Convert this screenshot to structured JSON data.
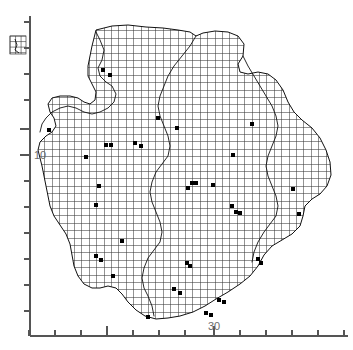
{
  "chart_data": {
    "type": "scatter",
    "title": "",
    "subtitle": "",
    "xlabel": "",
    "ylabel": "",
    "grid": true,
    "legend": "none",
    "axes": {
      "x": {
        "spine_color": "#555555",
        "tick_labels": [
          "30"
        ],
        "tick_label_values": [
          30
        ],
        "tick_label_positions_px": [
          214
        ],
        "tick_positions_px": [
          29,
          55,
          81,
          107,
          133,
          159,
          185,
          214,
          240,
          266,
          292,
          318,
          344
        ],
        "major_tick_positions_px": [
          107,
          214
        ],
        "axis_y_px": 336,
        "range_px": [
          29,
          348
        ],
        "tick_length": 6,
        "major_tick_length": 10
      },
      "y": {
        "spine_color": "#555555",
        "tick_labels": [
          "10"
        ],
        "tick_label_values": [
          10
        ],
        "tick_label_positions_px": [
          155
        ],
        "tick_positions_px": [
          22,
          48,
          74,
          100,
          129,
          155,
          181,
          207,
          233,
          259,
          285,
          311
        ],
        "major_tick_positions_px": [
          129,
          155
        ],
        "axis_x_px": 30,
        "range_px": [
          16,
          336
        ],
        "tick_length": 6,
        "major_tick_length": 10
      }
    },
    "colors": {
      "background": "#ffffff",
      "grid_mesh": "#3b3b3b",
      "boundary_line": "#111111",
      "marker": "#000000",
      "axis": "#555555",
      "tick_label": "#6b6b6b"
    },
    "mesh": {
      "description": "fine rectangular computational mesh covering an irregular land/region polygon",
      "cell_size_px": 7.4,
      "line_width": 0.55
    },
    "markers": {
      "shape": "square",
      "size_px": 4,
      "count": 38,
      "points_px": [
        [
          103,
          70
        ],
        [
          110,
          75
        ],
        [
          158,
          118
        ],
        [
          177,
          128
        ],
        [
          106,
          145
        ],
        [
          111,
          145
        ],
        [
          135,
          143
        ],
        [
          141,
          146
        ],
        [
          86,
          157
        ],
        [
          252,
          124
        ],
        [
          99,
          186
        ],
        [
          192,
          183
        ],
        [
          196,
          183
        ],
        [
          188,
          188
        ],
        [
          213,
          185
        ],
        [
          233,
          155
        ],
        [
          96,
          205
        ],
        [
          232,
          206
        ],
        [
          236,
          212
        ],
        [
          240,
          213
        ],
        [
          293,
          189
        ],
        [
          299,
          214
        ],
        [
          122,
          241
        ],
        [
          96,
          256
        ],
        [
          101,
          260
        ],
        [
          187,
          263
        ],
        [
          190,
          266
        ],
        [
          113,
          276
        ],
        [
          174,
          289
        ],
        [
          180,
          293
        ],
        [
          219,
          300
        ],
        [
          224,
          302
        ],
        [
          206,
          313
        ],
        [
          211,
          315
        ],
        [
          148,
          317
        ],
        [
          258,
          259
        ],
        [
          261,
          263
        ],
        [
          49,
          130
        ]
      ]
    },
    "inset": {
      "description": "small detached mesh patch outside the left axis near the top",
      "bbox_px": [
        10,
        36,
        16,
        18
      ]
    },
    "region_outline_px": [
      [
        96,
        30
      ],
      [
        112,
        26
      ],
      [
        128,
        25
      ],
      [
        146,
        27
      ],
      [
        163,
        28
      ],
      [
        178,
        30
      ],
      [
        190,
        32
      ],
      [
        196,
        36
      ],
      [
        203,
        33
      ],
      [
        215,
        31
      ],
      [
        228,
        32
      ],
      [
        238,
        36
      ],
      [
        244,
        44
      ],
      [
        243,
        56
      ],
      [
        238,
        64
      ],
      [
        240,
        72
      ],
      [
        248,
        74
      ],
      [
        258,
        72
      ],
      [
        268,
        74
      ],
      [
        276,
        80
      ],
      [
        283,
        90
      ],
      [
        288,
        102
      ],
      [
        294,
        112
      ],
      [
        302,
        120
      ],
      [
        312,
        128
      ],
      [
        320,
        138
      ],
      [
        326,
        150
      ],
      [
        330,
        162
      ],
      [
        331,
        175
      ],
      [
        327,
        186
      ],
      [
        320,
        194
      ],
      [
        312,
        199
      ],
      [
        305,
        206
      ],
      [
        303,
        216
      ],
      [
        300,
        226
      ],
      [
        292,
        234
      ],
      [
        282,
        240
      ],
      [
        272,
        246
      ],
      [
        264,
        255
      ],
      [
        258,
        266
      ],
      [
        250,
        276
      ],
      [
        240,
        284
      ],
      [
        228,
        292
      ],
      [
        216,
        299
      ],
      [
        205,
        306
      ],
      [
        193,
        312
      ],
      [
        180,
        316
      ],
      [
        168,
        318
      ],
      [
        156,
        319
      ],
      [
        145,
        316
      ],
      [
        136,
        310
      ],
      [
        128,
        302
      ],
      [
        122,
        294
      ],
      [
        116,
        288
      ],
      [
        108,
        286
      ],
      [
        100,
        288
      ],
      [
        92,
        288
      ],
      [
        84,
        284
      ],
      [
        78,
        276
      ],
      [
        74,
        266
      ],
      [
        72,
        255
      ],
      [
        70,
        244
      ],
      [
        66,
        234
      ],
      [
        60,
        225
      ],
      [
        54,
        216
      ],
      [
        50,
        206
      ],
      [
        48,
        196
      ],
      [
        46,
        186
      ],
      [
        44,
        176
      ],
      [
        42,
        166
      ],
      [
        40,
        158
      ],
      [
        38,
        150
      ],
      [
        40,
        142
      ],
      [
        46,
        136
      ],
      [
        52,
        132
      ],
      [
        56,
        126
      ],
      [
        54,
        118
      ],
      [
        50,
        112
      ],
      [
        48,
        104
      ],
      [
        52,
        98
      ],
      [
        60,
        96
      ],
      [
        70,
        96
      ],
      [
        78,
        98
      ],
      [
        84,
        102
      ],
      [
        90,
        104
      ],
      [
        95,
        100
      ],
      [
        96,
        92
      ],
      [
        92,
        84
      ],
      [
        88,
        76
      ],
      [
        88,
        66
      ],
      [
        90,
        56
      ],
      [
        92,
        46
      ],
      [
        94,
        38
      ],
      [
        96,
        30
      ]
    ],
    "internal_boundaries": [
      {
        "name": "upper-internal-boundary",
        "points_px": [
          [
            96,
            32
          ],
          [
            100,
            40
          ],
          [
            104,
            50
          ],
          [
            102,
            60
          ],
          [
            98,
            68
          ],
          [
            100,
            76
          ],
          [
            106,
            82
          ],
          [
            112,
            86
          ],
          [
            116,
            94
          ],
          [
            114,
            102
          ],
          [
            108,
            108
          ],
          [
            100,
            112
          ],
          [
            92,
            114
          ],
          [
            84,
            112
          ],
          [
            76,
            108
          ],
          [
            68,
            106
          ],
          [
            60,
            108
          ],
          [
            52,
            112
          ],
          [
            46,
            118
          ],
          [
            42,
            124
          ],
          [
            40,
            132
          ]
        ]
      },
      {
        "name": "diagonal-internal-boundary",
        "points_px": [
          [
            196,
            36
          ],
          [
            190,
            46
          ],
          [
            182,
            56
          ],
          [
            174,
            66
          ],
          [
            168,
            76
          ],
          [
            164,
            86
          ],
          [
            160,
            96
          ],
          [
            158,
            106
          ],
          [
            160,
            116
          ],
          [
            164,
            126
          ],
          [
            168,
            136
          ],
          [
            170,
            146
          ],
          [
            168,
            156
          ],
          [
            162,
            164
          ],
          [
            156,
            172
          ],
          [
            152,
            182
          ],
          [
            150,
            192
          ],
          [
            152,
            202
          ],
          [
            156,
            212
          ],
          [
            160,
            222
          ],
          [
            162,
            232
          ],
          [
            160,
            242
          ],
          [
            154,
            250
          ],
          [
            148,
            258
          ],
          [
            144,
            268
          ],
          [
            142,
            278
          ],
          [
            144,
            288
          ],
          [
            148,
            296
          ],
          [
            152,
            306
          ],
          [
            154,
            316
          ]
        ]
      },
      {
        "name": "right-internal-boundary",
        "points_px": [
          [
            243,
            56
          ],
          [
            248,
            66
          ],
          [
            254,
            76
          ],
          [
            260,
            86
          ],
          [
            266,
            96
          ],
          [
            272,
            106
          ],
          [
            276,
            116
          ],
          [
            278,
            126
          ],
          [
            276,
            136
          ],
          [
            272,
            146
          ],
          [
            268,
            156
          ],
          [
            266,
            166
          ],
          [
            268,
            176
          ],
          [
            272,
            186
          ],
          [
            276,
            196
          ],
          [
            278,
            206
          ],
          [
            276,
            216
          ],
          [
            270,
            224
          ],
          [
            264,
            232
          ],
          [
            258,
            242
          ],
          [
            254,
            252
          ],
          [
            252,
            262
          ]
        ]
      }
    ]
  }
}
